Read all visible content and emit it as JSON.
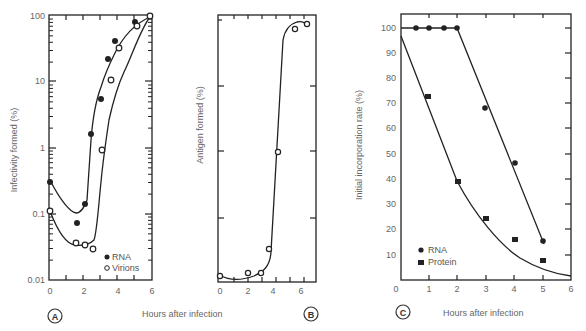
{
  "chart_data": [
    {
      "panel": "A",
      "type": "line",
      "ylabel": "Infectivity formed (%)",
      "xlabel": "Hours after infection",
      "yscale": "log",
      "ylim": [
        0.01,
        100
      ],
      "xlim": [
        0,
        6
      ],
      "xticks": [
        "0",
        "2",
        "4",
        "6"
      ],
      "yticks": [
        "0.01",
        "0.1",
        "1",
        "10",
        "100"
      ],
      "legend": [
        "RNA",
        "Virions"
      ],
      "legend_position": "lower right",
      "series": [
        {
          "name": "RNA",
          "marker": "filled-circle",
          "x": [
            0,
            1.5,
            2.0,
            2.3,
            2.8,
            3.3,
            3.8,
            5.0,
            5.8
          ],
          "y": [
            0.33,
            0.08,
            0.15,
            1.7,
            5.5,
            22,
            42,
            85,
            100
          ]
        },
        {
          "name": "Virions",
          "marker": "open-circle",
          "x": [
            0,
            1.5,
            2.0,
            2.5,
            3.0,
            3.5,
            4.0,
            5.0,
            6.0
          ],
          "y": [
            0.12,
            0.028,
            0.036,
            0.031,
            0.95,
            11,
            33,
            72,
            100
          ]
        }
      ]
    },
    {
      "panel": "B",
      "type": "line",
      "ylabel": "Antigen formed (%)",
      "xlabel": "Hours after infection",
      "xlim": [
        0,
        7
      ],
      "xticks": [
        "0",
        "2",
        "4",
        "6"
      ],
      "series": [
        {
          "name": "Antigen",
          "marker": "open-circle",
          "x": [
            0,
            2,
            3,
            3.6,
            5.7,
            6.3
          ],
          "y": [
            0.3,
            1.5,
            1.5,
            10,
            85,
            88
          ]
        }
      ]
    },
    {
      "panel": "C",
      "type": "line",
      "ylabel": "Initial incorporation rate (%)",
      "xlabel": "Hours after infection",
      "xlim": [
        0,
        6
      ],
      "ylim": [
        0,
        105
      ],
      "xticks": [
        "0",
        "1",
        "2",
        "3",
        "4",
        "5",
        "6"
      ],
      "yticks": [
        "10",
        "20",
        "30",
        "40",
        "50",
        "60",
        "70",
        "80",
        "90",
        "100"
      ],
      "legend": [
        "RNA",
        "Protein"
      ],
      "legend_position": "lower left",
      "series": [
        {
          "name": "RNA",
          "marker": "filled-circle",
          "x": [
            0.5,
            1,
            1.5,
            2,
            3,
            4,
            5
          ],
          "y": [
            100,
            100,
            100,
            100,
            68,
            46,
            16
          ]
        },
        {
          "name": "Protein",
          "marker": "filled-square",
          "x": [
            1,
            2,
            3,
            4,
            5
          ],
          "y": [
            72,
            40,
            25,
            16,
            8
          ]
        }
      ]
    }
  ],
  "labels": {
    "panel_a": "A",
    "panel_b": "B",
    "panel_c": "C",
    "a_ylabel": "Infectivity formed (%)",
    "b_ylabel": "Antigen formed (%)",
    "c_ylabel": "Initial incorporation rate (%)",
    "ab_xlabel": "Hours after infection",
    "c_xlabel": "Hours after infection",
    "legend_a_rna": "RNA",
    "legend_a_virions": "Virions",
    "legend_c_rna": "RNA",
    "legend_c_protein": "Protein",
    "a_yticks": [
      "100",
      "10",
      "1",
      "0.1",
      "0.01"
    ],
    "a_xticks": [
      "0",
      "2",
      "4",
      "6"
    ],
    "b_xticks": [
      "0",
      "2",
      "4",
      "6"
    ],
    "c_yticks": [
      "100",
      "90",
      "80",
      "70",
      "60",
      "50",
      "40",
      "30",
      "20",
      "10"
    ],
    "c_xticks": [
      "0",
      "1",
      "2",
      "3",
      "4",
      "5",
      "6"
    ]
  }
}
